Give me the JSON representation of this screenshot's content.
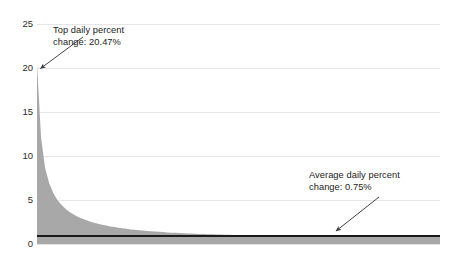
{
  "chart_data": {
    "type": "area",
    "title": "",
    "cropped_top_text": "",
    "xlabel": "",
    "ylabel": "",
    "ylim": [
      0,
      25
    ],
    "yticks": [
      0,
      5,
      10,
      15,
      20,
      25
    ],
    "ytick_labels": [
      "0",
      "5",
      "10",
      "15",
      "20",
      "25"
    ],
    "grid": true,
    "legend": "none",
    "xaxis_visible": false,
    "series": [
      {
        "name": "Daily percent change (sorted descending)",
        "type": "area",
        "color": "#a8a8a8",
        "max_value": 20.47,
        "values": [
          20.47,
          12.1,
          8.6,
          6.9,
          5.8,
          5.0,
          4.45,
          4.0,
          3.65,
          3.35,
          3.1,
          2.9,
          2.72,
          2.56,
          2.42,
          2.3,
          2.19,
          2.09,
          2.0,
          1.92,
          1.85,
          1.78,
          1.72,
          1.66,
          1.61,
          1.56,
          1.52,
          1.48,
          1.44,
          1.41,
          1.38,
          1.35,
          1.32,
          1.29,
          1.27,
          1.25,
          1.22,
          1.2,
          1.18,
          1.16,
          1.15,
          1.13,
          1.11,
          1.1,
          1.08,
          1.07,
          1.06,
          1.04,
          1.03,
          1.02,
          1.01,
          1.0,
          0.99,
          0.98,
          0.97,
          0.96,
          0.95,
          0.945,
          0.94,
          0.935,
          0.93,
          0.925,
          0.92,
          0.915,
          0.91,
          0.905,
          0.9,
          0.895,
          0.89,
          0.885,
          0.88,
          0.875,
          0.87,
          0.868,
          0.866,
          0.864,
          0.862,
          0.86,
          0.858,
          0.856,
          0.854,
          0.852,
          0.85,
          0.848,
          0.846,
          0.844,
          0.842,
          0.84,
          0.838,
          0.836,
          0.834,
          0.832,
          0.83,
          0.828,
          0.826,
          0.824,
          0.822,
          0.82,
          0.818,
          0.816
        ]
      },
      {
        "name": "Average daily percent change",
        "type": "line",
        "color": "#1a1a1a",
        "value": 0.75,
        "constant": true
      }
    ],
    "annotations": [
      {
        "id": "top-daily-percent-change",
        "text": "Top daily percent\nchange: 20.47%",
        "value": 20.47,
        "points_to": "series-peak"
      },
      {
        "id": "average-daily-percent-change",
        "text": "Average daily percent\nchange: 0.75%",
        "value": 0.75,
        "points_to": "average-line"
      }
    ]
  },
  "colors": {
    "area_fill": "#a8a8a8",
    "average_line": "#1a1a1a",
    "gridline": "#e6e6ea",
    "tick_text": "#2b2b2b",
    "annotation_text": "#1b1b1b",
    "background": "#ffffff"
  }
}
